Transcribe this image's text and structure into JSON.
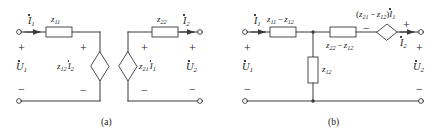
{
  "figure": {
    "captions": {
      "a": "(a)",
      "b": "(b)"
    },
    "line_color": "#3a3a3a",
    "text_color": "#1a1a1a"
  },
  "circuit_a": {
    "caption": "(a)",
    "description": "Two decoupled loops with controlled sources",
    "left_port": {
      "current_label": "I",
      "current_sub": "1",
      "voltage_label": "U",
      "voltage_sub": "1",
      "polarity_top": "+",
      "polarity_bottom": "−"
    },
    "right_port": {
      "current_label": "I",
      "current_sub": "2",
      "voltage_label": "U",
      "voltage_sub": "2",
      "polarity_top": "+",
      "polarity_bottom": "−"
    },
    "impedance_left": {
      "symbol": "z",
      "sub": "11"
    },
    "impedance_right": {
      "symbol": "z",
      "sub": "22"
    },
    "source_left": {
      "coefficient": "z",
      "coefficient_sub": "12",
      "current": "I",
      "current_sub": "2",
      "polarity_top": "+",
      "polarity_bottom": "−"
    },
    "source_right": {
      "coefficient": "z",
      "coefficient_sub": "21",
      "current": "I",
      "current_sub": "1",
      "polarity_top": "+",
      "polarity_bottom": "−"
    }
  },
  "circuit_b": {
    "caption": "(b)",
    "description": "T-equivalent network with one controlled source",
    "left_port": {
      "current_label": "I",
      "current_sub": "1",
      "voltage_label": "U",
      "voltage_sub": "1",
      "polarity_top": "+",
      "polarity_bottom": "−"
    },
    "right_port": {
      "current_label": "I",
      "current_sub": "2",
      "voltage_label": "U",
      "voltage_sub": "2",
      "polarity_top": "+",
      "polarity_bottom": "−"
    },
    "series_left": {
      "first": "z",
      "first_sub": "11",
      "op": "−",
      "second": "z",
      "second_sub": "12"
    },
    "series_right": {
      "first": "z",
      "first_sub": "22",
      "op": "−",
      "second": "z",
      "second_sub": "12"
    },
    "shunt": {
      "symbol": "z",
      "sub": "12"
    },
    "source": {
      "open": "(",
      "first": "z",
      "first_sub": "21",
      "op": "−",
      "second": "z",
      "second_sub": "12",
      "close": ")",
      "current": "I",
      "current_sub": "1",
      "polarity_left": "−",
      "polarity_right": "+"
    }
  }
}
